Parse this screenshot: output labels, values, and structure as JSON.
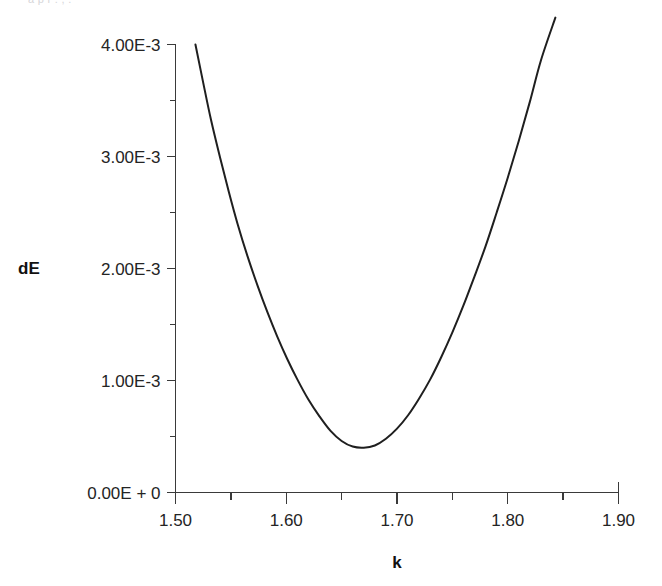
{
  "figure": {
    "caption_sliver": "a p  r                                            .                                                 ,              .",
    "background_color": "#ffffff",
    "line_color": "#1f1f1f",
    "axis_color": "#3a3a3a"
  },
  "chart_data": {
    "type": "line",
    "title": "",
    "xlabel": "k",
    "ylabel": "dE",
    "xlim": [
      1.5,
      1.9
    ],
    "ylim": [
      0.0,
      0.004
    ],
    "grid": false,
    "legend": null,
    "x_tick_labels": [
      "1.50",
      "1.60",
      "1.70",
      "1.80",
      "1.90"
    ],
    "x_tick_values": [
      1.5,
      1.6,
      1.7,
      1.8,
      1.9
    ],
    "x_minor_tick_values": [
      1.55,
      1.65,
      1.75,
      1.85
    ],
    "y_tick_labels": [
      "0.00E + 0",
      "1.00E-3",
      "2.00E-3",
      "3.00E-3",
      "4.00E-3"
    ],
    "y_tick_values": [
      0.0,
      0.001,
      0.002,
      0.003,
      0.004
    ],
    "y_minor_tick_values": [
      0.0005,
      0.0015,
      0.0025,
      0.0035
    ],
    "series": [
      {
        "name": "dE",
        "x": [
          1.518,
          1.525,
          1.532,
          1.54,
          1.548,
          1.556,
          1.565,
          1.574,
          1.583,
          1.592,
          1.601,
          1.61,
          1.62,
          1.63,
          1.64,
          1.65,
          1.66,
          1.67,
          1.68,
          1.69,
          1.7,
          1.71,
          1.72,
          1.73,
          1.74,
          1.75,
          1.76,
          1.77,
          1.78,
          1.79,
          1.8,
          1.81,
          1.82,
          1.83,
          1.843
        ],
        "y": [
          0.004,
          0.00366,
          0.00333,
          0.003,
          0.00269,
          0.0024,
          0.00211,
          0.00185,
          0.00161,
          0.00139,
          0.00119,
          0.00101,
          0.00083,
          0.00068,
          0.00055,
          0.00046,
          0.00041,
          0.0004,
          0.00042,
          0.00048,
          0.00057,
          0.00069,
          0.00084,
          0.00101,
          0.00121,
          0.00143,
          0.00167,
          0.00193,
          0.0022,
          0.0025,
          0.00281,
          0.00314,
          0.00349,
          0.00386,
          0.00424
        ]
      }
    ],
    "annotations": [],
    "minimum": {
      "x": 1.67,
      "y": 0.0004
    }
  }
}
